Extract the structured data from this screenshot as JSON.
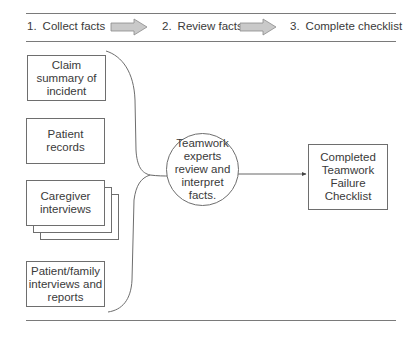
{
  "header": {
    "steps": [
      {
        "number": "1.",
        "label": "Collect facts"
      },
      {
        "number": "2.",
        "label": "Review facts"
      },
      {
        "number": "3.",
        "label": "Complete checklist"
      }
    ],
    "step_arrow_icon": "block-arrow-right-icon",
    "arrow_fill": "#c9c9c9",
    "arrow_stroke": "#8a8a8a"
  },
  "inputs": [
    {
      "label": "Claim summary of incident",
      "lines": [
        "Claim",
        "summary of",
        "incident"
      ]
    },
    {
      "label": "Patient records",
      "lines": [
        "Patient",
        "records"
      ]
    },
    {
      "label": "Caregiver interviews",
      "lines": [
        "Caregiver",
        "interviews"
      ],
      "stacked": true
    },
    {
      "label": "Patient/family interviews and reports",
      "lines": [
        "Patient/family",
        "interviews and",
        "reports"
      ]
    }
  ],
  "process": {
    "label": "Teamwork experts review and interpret facts.",
    "lines": [
      "Teamwork",
      "experts",
      "review and",
      "interpret",
      "facts."
    ]
  },
  "output": {
    "label": "Completed Teamwork Failure Checklist",
    "lines": [
      "Completed",
      "Teamwork",
      "Failure",
      "Checklist"
    ]
  },
  "colors": {
    "line": "#6e6e6e",
    "text": "#3a3a3a",
    "background": "#ffffff"
  }
}
